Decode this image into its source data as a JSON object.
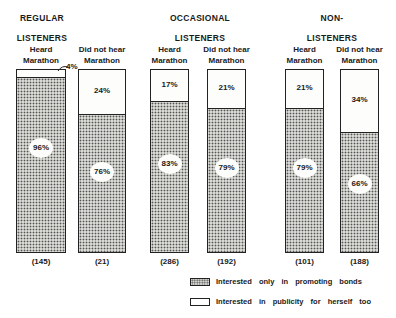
{
  "chart_data": {
    "type": "bar",
    "stacked": true,
    "percent_stacked": true,
    "title": "",
    "xlabel": "",
    "ylabel": "",
    "ylim": [
      0,
      100
    ],
    "grid": false,
    "legend_position": "bottom-right",
    "groups": [
      {
        "title_line1": "REGULAR",
        "title_line2": "LISTENERS"
      },
      {
        "title_line1": "OCCASIONAL",
        "title_line2": "LISTENERS"
      },
      {
        "title_line1": "NON-",
        "title_line2": "LISTENERS"
      }
    ],
    "categories": [
      "Regular Listeners - Heard Marathon",
      "Regular Listeners - Did not hear Marathon",
      "Occasional Listeners - Heard Marathon",
      "Occasional Listeners - Did not hear Marathon",
      "Non-Listeners - Heard Marathon",
      "Non-Listeners - Did not hear Marathon"
    ],
    "bar_labels": [
      {
        "line1": "Heard",
        "line2": "Marathon"
      },
      {
        "line1": "Did not hear",
        "line2": "Marathon"
      },
      {
        "line1": "Heard",
        "line2": "Marathon"
      },
      {
        "line1": "Did not hear",
        "line2": "Marathon"
      },
      {
        "line1": "Heard",
        "line2": "Marathon"
      },
      {
        "line1": "Did not hear",
        "line2": "Marathon"
      }
    ],
    "series": [
      {
        "name": "Interested only in promoting bonds",
        "pattern": "dotted",
        "values": [
          96,
          76,
          83,
          79,
          79,
          66
        ],
        "labels": [
          "96%",
          "76%",
          "83%",
          "79%",
          "79%",
          "66%"
        ]
      },
      {
        "name": "Interested in publicity for herself too",
        "pattern": "white",
        "values": [
          4,
          24,
          17,
          21,
          21,
          34
        ],
        "labels": [
          "4%",
          "24%",
          "17%",
          "21%",
          "21%",
          "34%"
        ]
      }
    ],
    "bases": [
      "(145)",
      "(21)",
      "(286)",
      "(192)",
      "(101)",
      "(188)"
    ]
  },
  "legend": {
    "items": [
      {
        "label": "Interested only in promoting bonds"
      },
      {
        "label": "Interested in publicity for herself too"
      }
    ]
  }
}
